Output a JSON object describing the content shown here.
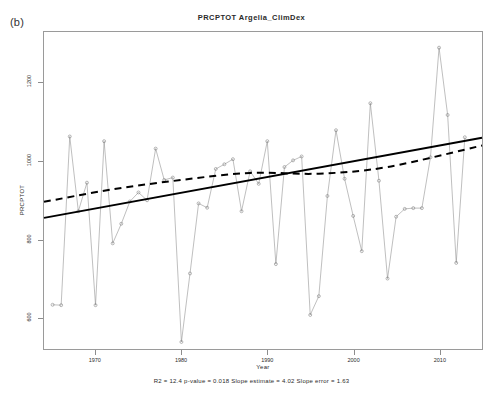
{
  "panel": {
    "tag": "(b)"
  },
  "chart_data": {
    "type": "line",
    "title": "PRCPTOT  Argelia_ClimDex",
    "xlabel": "Year",
    "ylabel": "PRCPTOT",
    "xlim": [
      1964,
      2015
    ],
    "ylim": [
      520,
      1330
    ],
    "grid": false,
    "legend": "none",
    "xticks": [
      1970,
      1980,
      1990,
      2000,
      2010
    ],
    "yticks": [
      600,
      800,
      1000,
      1200
    ],
    "annotation": "R2 = 12.4  p-value = 0.018  Slope estimate = 4.02  Slope error = 1.63",
    "stats": {
      "r2": "12.4",
      "p_value": "0.018",
      "slope_estimate": "4.02",
      "slope_error": "1.63"
    },
    "series": [
      {
        "name": "PRCPTOT",
        "marker": "open-circle",
        "x": [
          1965,
          1966,
          1967,
          1968,
          1969,
          1970,
          1971,
          1972,
          1973,
          1974,
          1975,
          1976,
          1977,
          1978,
          1979,
          1980,
          1981,
          1982,
          1983,
          1984,
          1985,
          1986,
          1987,
          1988,
          1989,
          1990,
          1991,
          1992,
          1993,
          1994,
          1995,
          1996,
          1997,
          1998,
          1999,
          2000,
          2001,
          2002,
          2003,
          2004,
          2005,
          2006,
          2007,
          2008,
          2009,
          2010,
          2011,
          2012,
          2013
        ],
        "y": [
          633,
          632,
          1063,
          872,
          945,
          632,
          1051,
          790,
          840,
          897,
          920,
          900,
          1032,
          952,
          958,
          538,
          713,
          892,
          881,
          980,
          992,
          1005,
          872,
          974,
          942,
          1051,
          737,
          985,
          1002,
          1012,
          607,
          655,
          911,
          1079,
          955,
          860,
          770,
          1148,
          950,
          700,
          858,
          878,
          880,
          880,
          1010,
          1290,
          1118,
          740,
          1061
        ]
      },
      {
        "name": "linear trend",
        "style": "solid",
        "color": "#000000",
        "endpoints": [
          [
            1964,
            855
          ],
          [
            2015,
            1060
          ]
        ]
      },
      {
        "name": "smoothed trend",
        "style": "dashed",
        "color": "#000000",
        "x": [
          1964,
          1972,
          1980,
          1988,
          1996,
          2004,
          2015
        ],
        "y": [
          896,
          928,
          952,
          970,
          968,
          985,
          1040
        ]
      }
    ]
  }
}
